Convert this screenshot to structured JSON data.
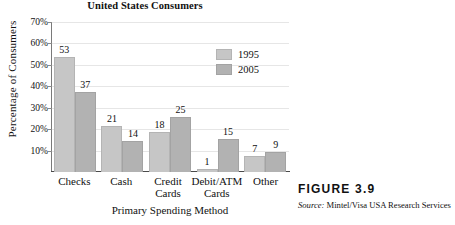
{
  "figure": {
    "number_label": "FIGURE  3.9",
    "source_prefix": "Source:",
    "source_text": "Mintel/Visa USA Research Services"
  },
  "chart_data": {
    "type": "bar",
    "title": "United States Consumers",
    "title_line_above": "",
    "xlabel": "Primary Spending Method",
    "ylabel": "Percentage of Consumers",
    "categories": [
      "Checks",
      "Cash",
      "Credit Cards",
      "Debit/ATM Cards",
      "Other"
    ],
    "category_lines": [
      [
        "Checks"
      ],
      [
        "Cash"
      ],
      [
        "Credit",
        "Cards"
      ],
      [
        "Debit/ATM",
        "Cards"
      ],
      [
        "Other"
      ]
    ],
    "series": [
      {
        "name": "1995",
        "color": "#c6c6c6",
        "values": [
          53,
          21,
          18,
          1,
          7
        ]
      },
      {
        "name": "2005",
        "color": "#b2b2b2",
        "values": [
          37,
          14,
          25,
          15,
          9
        ]
      }
    ],
    "ylim": [
      0,
      70
    ],
    "yticks": [
      10,
      20,
      30,
      40,
      50,
      60,
      70
    ],
    "ytick_labels": [
      "10%",
      "20%",
      "30%",
      "40%",
      "50%",
      "60%",
      "70%"
    ],
    "grid": true,
    "legend_position": "top-right"
  }
}
